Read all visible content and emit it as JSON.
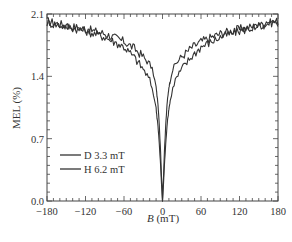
{
  "chart_data": {
    "type": "line",
    "title": "",
    "xlabel": "B (mT)",
    "xlabel_italic": "B",
    "xlabel_unit": " (mT)",
    "ylabel": "MEL (%)",
    "xlim": [
      -180,
      180
    ],
    "ylim": [
      0.0,
      2.1
    ],
    "xticks": [
      -180,
      -120,
      -60,
      0,
      60,
      120,
      180
    ],
    "xtick_labels": [
      "−180",
      "−120",
      "−60",
      "0",
      "60",
      "120",
      "180"
    ],
    "yticks": [
      0.0,
      0.7,
      1.4,
      2.1
    ],
    "ytick_labels": [
      "0.0",
      "0.7",
      "1.4",
      "2.1"
    ],
    "grid": false,
    "legend_position": "lower left",
    "series": [
      {
        "name": "D 3.3 mT",
        "color": "#333333",
        "x": [
          -180,
          -150,
          -120,
          -90,
          -60,
          -45,
          -30,
          -20,
          -15,
          -10,
          -7,
          -5,
          -3,
          -2,
          -1,
          0,
          1,
          2,
          3,
          5,
          7,
          10,
          15,
          20,
          30,
          45,
          60,
          90,
          120,
          150,
          180
        ],
        "y": [
          2.02,
          1.97,
          1.93,
          1.88,
          1.79,
          1.72,
          1.62,
          1.54,
          1.46,
          1.28,
          1.08,
          0.85,
          0.55,
          0.36,
          0.18,
          0.0,
          0.18,
          0.36,
          0.55,
          0.85,
          1.08,
          1.28,
          1.46,
          1.54,
          1.62,
          1.72,
          1.79,
          1.88,
          1.93,
          1.97,
          2.02
        ]
      },
      {
        "name": "H 6.2 mT",
        "color": "#333333",
        "x": [
          -180,
          -150,
          -120,
          -90,
          -60,
          -45,
          -30,
          -20,
          -15,
          -10,
          -7,
          -5,
          -3,
          -2,
          -1,
          0,
          1,
          2,
          3,
          5,
          7,
          10,
          15,
          20,
          30,
          45,
          60,
          90,
          120,
          150,
          180
        ],
        "y": [
          2.0,
          1.96,
          1.91,
          1.84,
          1.73,
          1.62,
          1.48,
          1.36,
          1.24,
          1.04,
          0.84,
          0.64,
          0.4,
          0.26,
          0.12,
          0.0,
          0.12,
          0.26,
          0.4,
          0.64,
          0.84,
          1.04,
          1.24,
          1.36,
          1.48,
          1.62,
          1.73,
          1.84,
          1.91,
          1.96,
          2.0
        ]
      }
    ]
  },
  "legend": {
    "items": [
      {
        "label": "D 3.3 mT"
      },
      {
        "label": "H 6.2 mT"
      }
    ]
  },
  "layout": {
    "plot_left": 47,
    "plot_right": 278,
    "plot_top": 14,
    "plot_bottom": 201,
    "line_color": "#333333",
    "axis_color": "#444444"
  }
}
